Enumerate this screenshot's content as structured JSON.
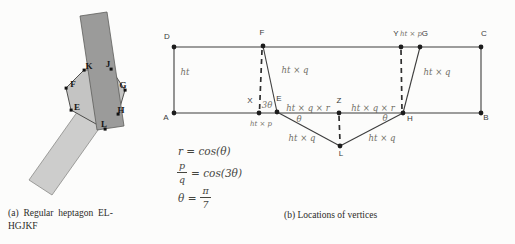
{
  "figure_a": {
    "caption_line1": "(a) Regular heptagon EL-",
    "caption_line2": "HGJKF",
    "vertices": {
      "K": "K",
      "J": "J",
      "F": "F",
      "G": "G",
      "E": "E",
      "H": "H",
      "L": "L"
    },
    "colors": {
      "dark_strip": "#9b9b9a",
      "light_strip": "#cdcdcc",
      "heptagon": "#c4c4c3"
    }
  },
  "figure_b": {
    "caption": "(b) Locations of vertices",
    "vertices": {
      "D": "D",
      "A": "A",
      "C": "C",
      "B": "B",
      "F": "F",
      "Y": "Y",
      "G": "G",
      "X": "X",
      "E": "E",
      "Z": "Z",
      "H": "H",
      "L": "L"
    },
    "labels": {
      "ht": "ht",
      "ht_q": "ht × q",
      "ht_p": "ht × p",
      "ht_q_r": "ht × q × r",
      "theta": "θ",
      "three_theta": "3θ"
    },
    "formulas": {
      "f1": "r = cos(θ)",
      "f2_num": "p",
      "f2_den": "q",
      "f2_rhs": "= cos(3θ)",
      "f3_lhs": "θ =",
      "f3_num": "π",
      "f3_den": "7"
    },
    "line_color": "#3d3d3d"
  }
}
